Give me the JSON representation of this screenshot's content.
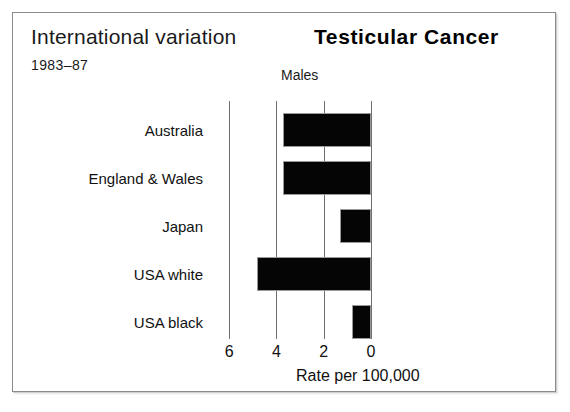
{
  "figure": {
    "header_title": "International variation",
    "header_subtitle": "1983–87",
    "chart_title": "Testicular Cancer",
    "sex_label": "Males"
  },
  "chart_data": {
    "type": "bar",
    "orientation": "horizontal",
    "direction": "right-to-left",
    "title": "Testicular Cancer",
    "subtitle": "International variation 1983–87",
    "annotations": [
      "Males"
    ],
    "xlabel": "Rate per 100,000",
    "ylabel": "",
    "xlim": [
      0,
      6
    ],
    "xticks": [
      6,
      4,
      2,
      0
    ],
    "xtick_labels": [
      "6",
      "4",
      "2",
      "0"
    ],
    "grid": true,
    "legend": null,
    "categories": [
      "Australia",
      "England & Wales",
      "Japan",
      "USA white",
      "USA black"
    ],
    "values": [
      3.7,
      3.7,
      1.3,
      4.8,
      0.8
    ],
    "series": [
      {
        "name": "Rate per 100,000",
        "values": [
          3.7,
          3.7,
          1.3,
          4.8,
          0.8
        ]
      }
    ],
    "bar_color": "#050505"
  },
  "axis": {
    "caption": "Rate per 100,000",
    "ticks": [
      {
        "label": "6",
        "value": 6
      },
      {
        "label": "4",
        "value": 4
      },
      {
        "label": "2",
        "value": 2
      },
      {
        "label": "0",
        "value": 0
      }
    ]
  },
  "rows": [
    {
      "label": "Australia",
      "value": 3.7
    },
    {
      "label": "England & Wales",
      "value": 3.7
    },
    {
      "label": "Japan",
      "value": 1.3
    },
    {
      "label": "USA white",
      "value": 4.8
    },
    {
      "label": "USA black",
      "value": 0.8
    }
  ]
}
